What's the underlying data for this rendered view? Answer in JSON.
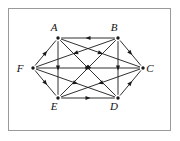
{
  "figure": {
    "border_color": "#9a9a9a",
    "edge_color": "#1a1a1a",
    "background_color": "#ffffff",
    "vertex_count": 6,
    "edge_count": 15
  },
  "vertices": [
    {
      "id": "A",
      "label": "A",
      "x": 58,
      "y": 38,
      "label_x": 54,
      "label_y": 31
    },
    {
      "id": "B",
      "label": "B",
      "x": 118,
      "y": 38,
      "label_x": 114,
      "label_y": 31
    },
    {
      "id": "C",
      "label": "C",
      "x": 143,
      "y": 68,
      "label_x": 150,
      "label_y": 72
    },
    {
      "id": "D",
      "label": "D",
      "x": 118,
      "y": 98,
      "label_x": 114,
      "label_y": 110
    },
    {
      "id": "E",
      "label": "E",
      "x": 58,
      "y": 98,
      "label_x": 54,
      "label_y": 110
    },
    {
      "id": "F",
      "label": "F",
      "x": 33,
      "y": 68,
      "label_x": 20,
      "label_y": 72
    }
  ],
  "edges": [
    {
      "from": "B",
      "to": "A",
      "kind": "hexagon-side"
    },
    {
      "from": "B",
      "to": "C",
      "kind": "hexagon-side"
    },
    {
      "from": "B",
      "to": "D",
      "kind": "long-diagonal"
    },
    {
      "from": "D",
      "to": "C",
      "kind": "hexagon-side"
    },
    {
      "from": "E",
      "to": "D",
      "kind": "hexagon-side"
    },
    {
      "from": "F",
      "to": "E",
      "kind": "hexagon-side"
    },
    {
      "from": "F",
      "to": "A",
      "kind": "hexagon-side"
    },
    {
      "from": "F",
      "to": "C",
      "kind": "long-diagonal"
    },
    {
      "from": "A",
      "to": "E",
      "kind": "long-diagonal"
    },
    {
      "from": "A",
      "to": "C",
      "kind": "short-diagonal"
    },
    {
      "from": "A",
      "to": "D",
      "kind": "short-diagonal"
    },
    {
      "from": "B",
      "to": "E",
      "kind": "short-diagonal"
    },
    {
      "from": "B",
      "to": "F",
      "kind": "short-diagonal"
    },
    {
      "from": "C",
      "to": "E",
      "kind": "short-diagonal"
    },
    {
      "from": "F",
      "to": "D",
      "kind": "short-diagonal"
    }
  ]
}
